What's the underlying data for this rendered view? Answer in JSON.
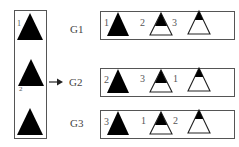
{
  "diagram": {
    "left_group": {
      "triangles": [
        {
          "fill": "black",
          "label": "1"
        },
        {
          "fill": "black",
          "label": "2"
        },
        {
          "fill": "black",
          "label": ""
        }
      ]
    },
    "arrow": {
      "target": "G2"
    },
    "groups": [
      {
        "name": "G1",
        "items": [
          {
            "label": "1",
            "fill": "full"
          },
          {
            "label": "2",
            "fill": "half"
          },
          {
            "label": "3",
            "fill": "top"
          }
        ]
      },
      {
        "name": "G2",
        "items": [
          {
            "label": "2",
            "fill": "full"
          },
          {
            "label": "3",
            "fill": "half"
          },
          {
            "label": "1",
            "fill": "top"
          }
        ]
      },
      {
        "name": "G3",
        "items": [
          {
            "label": "3",
            "fill": "full"
          },
          {
            "label": "1",
            "fill": "half"
          },
          {
            "label": "2",
            "fill": "top"
          }
        ]
      }
    ],
    "colors": {
      "fill": "#000000",
      "stroke": "#333333",
      "border": "#555555"
    }
  }
}
